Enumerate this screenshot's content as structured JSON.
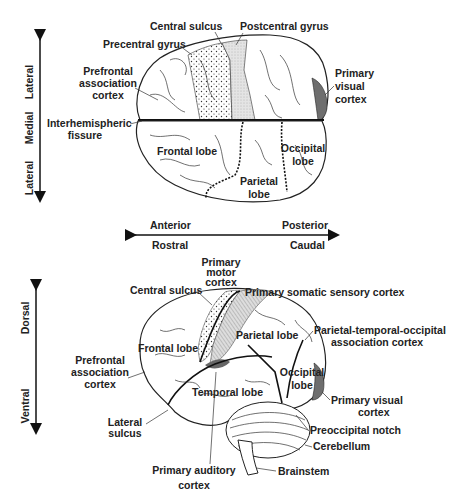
{
  "top_view": {
    "axis_vertical": {
      "top": "Lateral",
      "middle": "Medial",
      "bottom": "Lateral"
    },
    "axis_horizontal": {
      "left_top": "Anterior",
      "left_bottom": "Rostral",
      "right_top": "Posterior",
      "right_bottom": "Caudal"
    },
    "labels": {
      "central_sulcus": "Central sulcus",
      "postcentral_gyrus": "Postcentral gyrus",
      "precentral_gyrus": "Precentral gyrus",
      "prefrontal_1": "Prefrontal",
      "prefrontal_2": "association",
      "prefrontal_3": "cortex",
      "visual_1": "Primary",
      "visual_2": "visual",
      "visual_3": "cortex",
      "interhemispheric_1": "Interhemispheric",
      "interhemispheric_2": "fissure",
      "frontal_lobe": "Frontal lobe",
      "occipital_1": "Occipital",
      "occipital_2": "lobe",
      "parietal_1": "Parietal",
      "parietal_2": "lobe"
    }
  },
  "side_view": {
    "axis_vertical": {
      "top": "Dorsal",
      "bottom": "Ventral"
    },
    "labels": {
      "motor_1": "Primary",
      "motor_2": "motor",
      "motor_3": "cortex",
      "central_sulcus": "Central sulcus",
      "somatic": "Primary somatic sensory cortex",
      "parietal_lobe": "Parietal lobe",
      "pto_1": "Parietal-temporal-occipital",
      "pto_2": "association cortex",
      "frontal_lobe": "Frontal lobe",
      "prefrontal_1": "Prefrontal",
      "prefrontal_2": "association",
      "prefrontal_3": "cortex",
      "temporal_lobe": "Temporal lobe",
      "occipital_1": "Occipital",
      "occipital_2": "lobe",
      "visual_1": "Primary visual",
      "visual_2": "cortex",
      "lateral_1": "Lateral",
      "lateral_2": "sulcus",
      "preoccipital": "Preoccipital notch",
      "cerebellum": "Cerebellum",
      "auditory_1": "Primary auditory",
      "auditory_2": "cortex",
      "brainstem": "Brainstem"
    }
  },
  "colors": {
    "visual_cortex": "#6e6e6e",
    "ink": "#222222",
    "background": "#ffffff"
  }
}
